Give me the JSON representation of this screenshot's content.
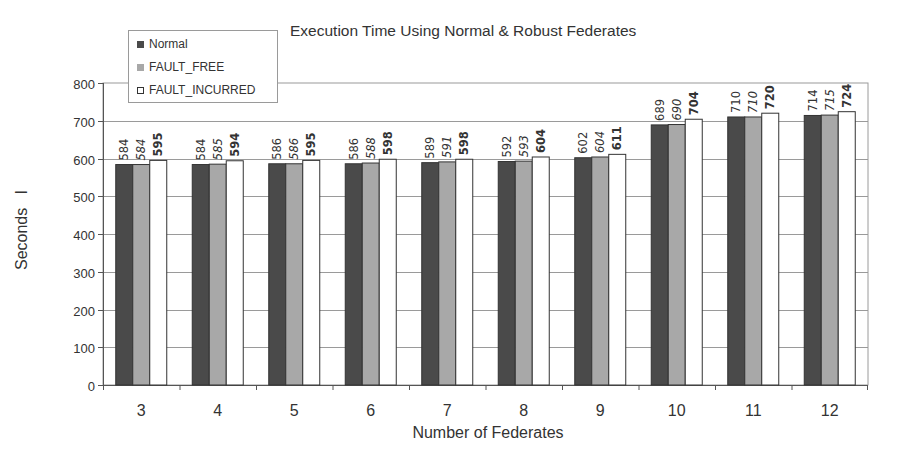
{
  "chart_data": {
    "type": "bar",
    "title": "Execution Time Using Normal & Robust Federates",
    "xlabel": "Number of Federates",
    "ylabel": "Seconds   I",
    "categories": [
      "3",
      "4",
      "5",
      "6",
      "7",
      "8",
      "9",
      "10",
      "11",
      "12"
    ],
    "series": [
      {
        "name": "Normal",
        "color": "#4a4a4a",
        "label_style": "normal",
        "values": [
          584,
          584,
          586,
          586,
          589,
          592,
          602,
          689,
          710,
          714
        ]
      },
      {
        "name": "FAULT_FREE",
        "color": "#a8a8a8",
        "label_style": "italic",
        "values": [
          584,
          585,
          586,
          588,
          591,
          593,
          604,
          690,
          710,
          715
        ]
      },
      {
        "name": "FAULT_INCURRED",
        "color": "#ffffff",
        "label_style": "bold",
        "values": [
          595,
          594,
          595,
          598,
          598,
          604,
          611,
          704,
          720,
          724
        ]
      }
    ],
    "ylim": [
      0,
      800
    ],
    "yticks": [
      0,
      100,
      200,
      300,
      400,
      500,
      600,
      700,
      800
    ],
    "grid": true,
    "legend_position": "top-left"
  }
}
